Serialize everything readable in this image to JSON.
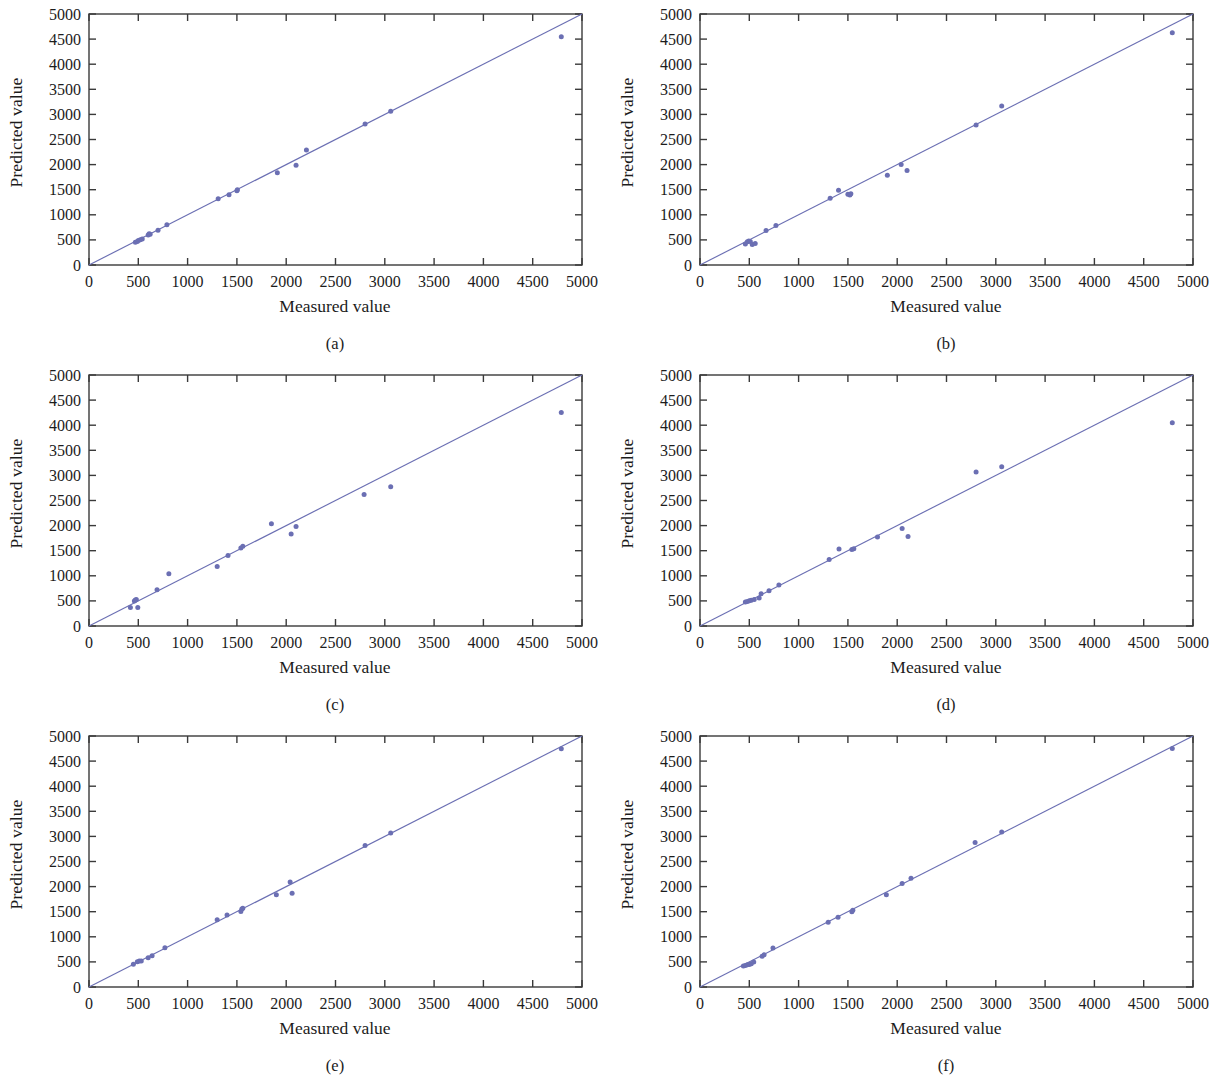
{
  "figure": {
    "background_color": "#ffffff",
    "marker_color": "#6b6fb3",
    "line_color": "#6b6fb3",
    "frame_color": "#3a3a3a",
    "text_color": "#1c1c1c",
    "axis_titles": {
      "x": "Measured value",
      "y": "Predicted value"
    },
    "captions": {
      "a": "(a)",
      "b": "(b)",
      "c": "(c)",
      "d": "(d)",
      "e": "(e)",
      "f": "(f)"
    }
  },
  "chart_data": [
    {
      "id": "a",
      "type": "scatter",
      "title": "",
      "caption": "(a)",
      "xlabel": "Measured value",
      "ylabel": "Predicted value",
      "xlim": [
        0,
        5000
      ],
      "ylim": [
        0,
        5000
      ],
      "xticks": [
        0,
        500,
        1000,
        1500,
        2000,
        2500,
        3000,
        3500,
        4000,
        4500,
        5000
      ],
      "yticks": [
        0,
        500,
        1000,
        1500,
        2000,
        2500,
        3000,
        3500,
        4000,
        4500,
        5000
      ],
      "xtick_labels": [
        "0",
        "500",
        "1000",
        "1500",
        "2000",
        "2500",
        "3000",
        "3500",
        "4000",
        "4500",
        "5000"
      ],
      "ytick_labels": [
        "0",
        "500",
        "1000",
        "1500",
        "2000",
        "2500",
        "3000",
        "3500",
        "4000",
        "4500",
        "5000"
      ],
      "grid": false,
      "legend": null,
      "reference_line": {
        "type": "identity",
        "from": [
          0,
          0
        ],
        "to": [
          5000,
          5000
        ]
      },
      "points": [
        [
          470,
          455
        ],
        [
          490,
          470
        ],
        [
          500,
          490
        ],
        [
          520,
          505
        ],
        [
          540,
          520
        ],
        [
          600,
          600
        ],
        [
          610,
          625
        ],
        [
          620,
          615
        ],
        [
          700,
          690
        ],
        [
          790,
          800
        ],
        [
          1310,
          1320
        ],
        [
          1420,
          1400
        ],
        [
          1500,
          1480
        ],
        [
          1505,
          1500
        ],
        [
          1910,
          1840
        ],
        [
          2100,
          1985
        ],
        [
          2205,
          2290
        ],
        [
          2800,
          2810
        ],
        [
          3060,
          3065
        ],
        [
          4790,
          4545
        ]
      ]
    },
    {
      "id": "b",
      "type": "scatter",
      "title": "",
      "caption": "(b)",
      "xlabel": "Measured value",
      "ylabel": "Predicted value",
      "xlim": [
        0,
        5000
      ],
      "ylim": [
        0,
        5000
      ],
      "xticks": [
        0,
        500,
        1000,
        1500,
        2000,
        2500,
        3000,
        3500,
        4000,
        4500,
        5000
      ],
      "yticks": [
        0,
        500,
        1000,
        1500,
        2000,
        2500,
        3000,
        3500,
        4000,
        4500,
        5000
      ],
      "xtick_labels": [
        "0",
        "500",
        "1000",
        "1500",
        "2000",
        "2500",
        "3000",
        "3500",
        "4000",
        "4500",
        "5000"
      ],
      "ytick_labels": [
        "0",
        "500",
        "1000",
        "1500",
        "2000",
        "2500",
        "3000",
        "3500",
        "4000",
        "4500",
        "5000"
      ],
      "grid": false,
      "legend": null,
      "reference_line": {
        "type": "identity",
        "from": [
          0,
          0
        ],
        "to": [
          5000,
          5000
        ]
      },
      "points": [
        [
          460,
          420
        ],
        [
          480,
          465
        ],
        [
          495,
          480
        ],
        [
          510,
          470
        ],
        [
          530,
          410
        ],
        [
          560,
          430
        ],
        [
          670,
          685
        ],
        [
          770,
          785
        ],
        [
          1320,
          1330
        ],
        [
          1405,
          1490
        ],
        [
          1500,
          1410
        ],
        [
          1520,
          1395
        ],
        [
          1530,
          1420
        ],
        [
          1900,
          1790
        ],
        [
          2040,
          2000
        ],
        [
          2100,
          1880
        ],
        [
          2800,
          2790
        ],
        [
          3060,
          3165
        ],
        [
          4790,
          4625
        ]
      ]
    },
    {
      "id": "c",
      "type": "scatter",
      "title": "",
      "caption": "(c)",
      "xlabel": "Measured value",
      "ylabel": "Predicted value",
      "xlim": [
        0,
        5000
      ],
      "ylim": [
        0,
        5000
      ],
      "xticks": [
        0,
        500,
        1000,
        1500,
        2000,
        2500,
        3000,
        3500,
        4000,
        4500,
        5000
      ],
      "yticks": [
        0,
        500,
        1000,
        1500,
        2000,
        2500,
        3000,
        3500,
        4000,
        4500,
        5000
      ],
      "xtick_labels": [
        "0",
        "500",
        "1000",
        "1500",
        "2000",
        "2500",
        "3000",
        "3500",
        "4000",
        "4500",
        "5000"
      ],
      "ytick_labels": [
        "0",
        "500",
        "1000",
        "1500",
        "2000",
        "2500",
        "3000",
        "3500",
        "4000",
        "4500",
        "5000"
      ],
      "grid": false,
      "legend": null,
      "reference_line": {
        "type": "identity",
        "from": [
          0,
          0
        ],
        "to": [
          5000,
          5000
        ]
      },
      "points": [
        [
          420,
          370
        ],
        [
          460,
          500
        ],
        [
          470,
          520
        ],
        [
          480,
          530
        ],
        [
          495,
          370
        ],
        [
          690,
          720
        ],
        [
          810,
          1040
        ],
        [
          1300,
          1185
        ],
        [
          1410,
          1405
        ],
        [
          1540,
          1555
        ],
        [
          1560,
          1590
        ],
        [
          1850,
          2035
        ],
        [
          2050,
          1835
        ],
        [
          2100,
          1980
        ],
        [
          2790,
          2620
        ],
        [
          3060,
          2775
        ],
        [
          4790,
          4255
        ]
      ]
    },
    {
      "id": "d",
      "type": "scatter",
      "title": "",
      "caption": "(d)",
      "xlabel": "Measured value",
      "ylabel": "Predicted value",
      "xlim": [
        0,
        5000
      ],
      "ylim": [
        0,
        5000
      ],
      "xticks": [
        0,
        500,
        1000,
        1500,
        2000,
        2500,
        3000,
        3500,
        4000,
        4500,
        5000
      ],
      "yticks": [
        0,
        500,
        1000,
        1500,
        2000,
        2500,
        3000,
        3500,
        4000,
        4500,
        5000
      ],
      "xtick_labels": [
        "0",
        "500",
        "1000",
        "1500",
        "2000",
        "2500",
        "3000",
        "3500",
        "4000",
        "4500",
        "5000"
      ],
      "ytick_labels": [
        "0",
        "500",
        "1000",
        "1500",
        "2000",
        "2500",
        "3000",
        "3500",
        "4000",
        "4500",
        "5000"
      ],
      "grid": false,
      "legend": null,
      "reference_line": {
        "type": "identity",
        "from": [
          0,
          0
        ],
        "to": [
          5000,
          5000
        ]
      },
      "points": [
        [
          460,
          480
        ],
        [
          480,
          490
        ],
        [
          500,
          505
        ],
        [
          520,
          515
        ],
        [
          550,
          530
        ],
        [
          600,
          560
        ],
        [
          620,
          640
        ],
        [
          700,
          700
        ],
        [
          800,
          815
        ],
        [
          1310,
          1325
        ],
        [
          1410,
          1535
        ],
        [
          1540,
          1525
        ],
        [
          1560,
          1540
        ],
        [
          1800,
          1775
        ],
        [
          2050,
          1940
        ],
        [
          2110,
          1785
        ],
        [
          2800,
          3070
        ],
        [
          3060,
          3170
        ],
        [
          4790,
          4050
        ]
      ]
    },
    {
      "id": "e",
      "type": "scatter",
      "title": "",
      "caption": "(e)",
      "xlabel": "Measured value",
      "ylabel": "Predicted value",
      "xlim": [
        0,
        5000
      ],
      "ylim": [
        0,
        5000
      ],
      "xticks": [
        0,
        500,
        1000,
        1500,
        2000,
        2500,
        3000,
        3500,
        4000,
        4500,
        5000
      ],
      "yticks": [
        0,
        500,
        1000,
        1500,
        2000,
        2500,
        3000,
        3500,
        4000,
        4500,
        5000
      ],
      "xtick_labels": [
        "0",
        "500",
        "1000",
        "1500",
        "2000",
        "2500",
        "3000",
        "3500",
        "4000",
        "4500",
        "5000"
      ],
      "ytick_labels": [
        "0",
        "500",
        "1000",
        "1500",
        "2000",
        "2500",
        "3000",
        "3500",
        "4000",
        "4500",
        "5000"
      ],
      "grid": false,
      "legend": null,
      "reference_line": {
        "type": "identity",
        "from": [
          0,
          0
        ],
        "to": [
          5000,
          5000
        ]
      },
      "points": [
        [
          450,
          455
        ],
        [
          490,
          505
        ],
        [
          510,
          520
        ],
        [
          530,
          520
        ],
        [
          600,
          585
        ],
        [
          640,
          625
        ],
        [
          770,
          780
        ],
        [
          1300,
          1340
        ],
        [
          1400,
          1435
        ],
        [
          1540,
          1505
        ],
        [
          1550,
          1555
        ],
        [
          1560,
          1570
        ],
        [
          1900,
          1840
        ],
        [
          2040,
          2090
        ],
        [
          2060,
          1870
        ],
        [
          2800,
          2820
        ],
        [
          3060,
          3070
        ],
        [
          4790,
          4745
        ]
      ]
    },
    {
      "id": "f",
      "type": "scatter",
      "title": "",
      "caption": "(f)",
      "xlabel": "Measured value",
      "ylabel": "Predicted value",
      "xlim": [
        0,
        5000
      ],
      "ylim": [
        0,
        5000
      ],
      "xticks": [
        0,
        500,
        1000,
        1500,
        2000,
        2500,
        3000,
        3500,
        4000,
        4500,
        5000
      ],
      "yticks": [
        0,
        500,
        1000,
        1500,
        2000,
        2500,
        3000,
        3500,
        4000,
        4500,
        5000
      ],
      "xtick_labels": [
        "0",
        "500",
        "1000",
        "1500",
        "2000",
        "2500",
        "3000",
        "3500",
        "4000",
        "4500",
        "5000"
      ],
      "ytick_labels": [
        "0",
        "500",
        "1000",
        "1500",
        "2000",
        "2500",
        "3000",
        "3500",
        "4000",
        "4500",
        "5000"
      ],
      "grid": false,
      "legend": null,
      "reference_line": {
        "type": "identity",
        "from": [
          0,
          0
        ],
        "to": [
          5000,
          5000
        ]
      },
      "points": [
        [
          440,
          420
        ],
        [
          460,
          430
        ],
        [
          480,
          445
        ],
        [
          500,
          450
        ],
        [
          520,
          465
        ],
        [
          545,
          500
        ],
        [
          630,
          615
        ],
        [
          650,
          640
        ],
        [
          740,
          775
        ],
        [
          1300,
          1290
        ],
        [
          1400,
          1390
        ],
        [
          1540,
          1500
        ],
        [
          1550,
          1530
        ],
        [
          1890,
          1840
        ],
        [
          2050,
          2060
        ],
        [
          2140,
          2165
        ],
        [
          2790,
          2880
        ],
        [
          3060,
          3090
        ],
        [
          4790,
          4750
        ]
      ]
    }
  ]
}
